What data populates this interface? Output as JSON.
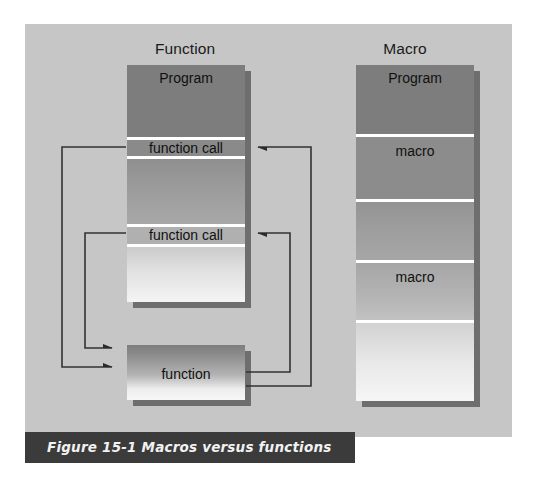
{
  "figure": {
    "caption": "Figure 15-1 Macros versus functions",
    "caption_bar_color": "#3b3b3b",
    "caption_text_color": "#f2f2f2",
    "panel_background": "#c6c6c6",
    "page_background": "#ffffff"
  },
  "columns": [
    {
      "id": "function",
      "title": "Function",
      "program_box": {
        "name": "Program",
        "segments": [
          {
            "label": "Program",
            "kind": "header"
          },
          {
            "label": "function call",
            "kind": "call"
          },
          {
            "label": "",
            "kind": "body"
          },
          {
            "label": "function call",
            "kind": "call"
          },
          {
            "label": "",
            "kind": "body"
          }
        ]
      },
      "callee_box": {
        "label": "function"
      }
    },
    {
      "id": "macro",
      "title": "Macro",
      "program_box": {
        "name": "Program",
        "segments": [
          {
            "label": "Program",
            "kind": "header"
          },
          {
            "label": "macro",
            "kind": "expansion"
          },
          {
            "label": "",
            "kind": "body"
          },
          {
            "label": "macro",
            "kind": "expansion"
          },
          {
            "label": "",
            "kind": "body"
          }
        ]
      },
      "callee_box": null
    }
  ],
  "arrows": [
    {
      "id": "call-1-out",
      "from": "function call 1",
      "to": "function",
      "direction": "right",
      "side": "left"
    },
    {
      "id": "call-2-out",
      "from": "function call 2",
      "to": "function",
      "direction": "right",
      "side": "left"
    },
    {
      "id": "return-1-back",
      "from": "function",
      "to": "function call 1",
      "direction": "left",
      "side": "right"
    },
    {
      "id": "return-2-back",
      "from": "function",
      "to": "function call 2",
      "direction": "left",
      "side": "right"
    }
  ],
  "colors": {
    "wire": "#333333",
    "shadow": "#6e6e6e",
    "divider": "#ffffff",
    "segment_dark": "#7d7d7d",
    "segment_light": "#f2f2f2",
    "text": "#101010"
  }
}
